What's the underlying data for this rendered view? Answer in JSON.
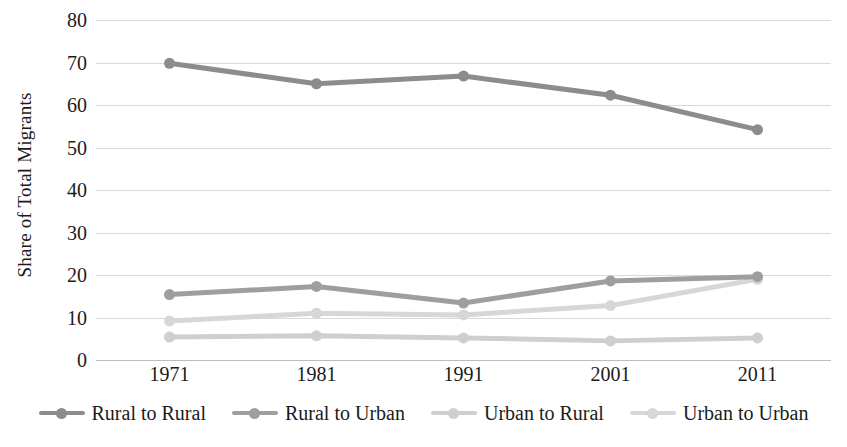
{
  "chart_data": {
    "type": "line",
    "title": "",
    "xlabel": "",
    "ylabel": "Share of Total Migrants",
    "categories": [
      "1971",
      "1981",
      "1991",
      "2001",
      "2011"
    ],
    "ylim": [
      0,
      80
    ],
    "yticks": [
      "0",
      "10",
      "20",
      "30",
      "40",
      "50",
      "60",
      "70",
      "80"
    ],
    "grid": true,
    "legend_position": "bottom",
    "series": [
      {
        "name": "Rural to Rural",
        "color": "#8c8c8c",
        "values": [
          69.8,
          65.0,
          66.8,
          62.3,
          54.2
        ]
      },
      {
        "name": "Rural to Urban",
        "color": "#9e9e9e",
        "values": [
          15.4,
          17.3,
          13.4,
          18.6,
          19.6
        ]
      },
      {
        "name": "Urban to Rural",
        "color": "#cfcfcf",
        "values": [
          5.4,
          5.7,
          5.2,
          4.5,
          5.2
        ]
      },
      {
        "name": "Urban to Urban",
        "color": "#d7d7d7",
        "values": [
          9.2,
          11.0,
          10.6,
          12.8,
          19.0
        ]
      }
    ]
  }
}
